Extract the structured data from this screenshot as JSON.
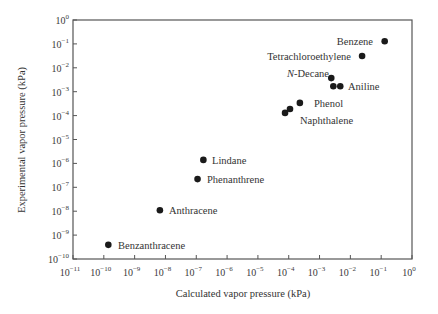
{
  "chart_data": {
    "type": "scatter",
    "title": "",
    "xlabel": "Calculated vapor pressure (kPa)",
    "ylabel": "Experimental vapor pressure (kPa)",
    "xscale": "log",
    "yscale": "log",
    "xlim": [
      1e-11,
      1
    ],
    "ylim": [
      1e-10,
      1
    ],
    "grid": false,
    "legend": null,
    "x_ticks": [
      "10^-11",
      "10^-10",
      "10^-9",
      "10^-8",
      "10^-7",
      "10^-6",
      "10^-5",
      "10^-4",
      "10^-3",
      "10^-2",
      "10^-1",
      "10^0"
    ],
    "y_ticks": [
      "10^-10",
      "10^-9",
      "10^-8",
      "10^-7",
      "10^-6",
      "10^-5",
      "10^-4",
      "10^-3",
      "10^-2",
      "10^-1",
      "10^0"
    ],
    "points": [
      {
        "label": "Benzene",
        "x": 0.13,
        "y": 0.13,
        "label_side": "left"
      },
      {
        "label": "Tetrachloroethylene",
        "x": 0.024,
        "y": 0.031,
        "label_side": "left"
      },
      {
        "label": "N-Decane",
        "x": 0.0024,
        "y": 0.0037,
        "label_side": "left",
        "italic_prefix": "N"
      },
      {
        "label": "Aniline",
        "x": 0.0028,
        "y": 0.0017,
        "label_side": "none"
      },
      {
        "label": "Aniline",
        "x": 0.0047,
        "y": 0.0017,
        "label_side": "right"
      },
      {
        "label": "Phenol",
        "x": 0.00023,
        "y": 0.00034,
        "label_side": "right"
      },
      {
        "label": "Naphthalene",
        "x": 0.00011,
        "y": 0.00019,
        "label_side": "below"
      },
      {
        "label": "Naphthalene",
        "x": 7.6e-05,
        "y": 0.00013,
        "label_side": "none"
      },
      {
        "label": "Lindane",
        "x": 1.7e-07,
        "y": 1.4e-06,
        "label_side": "right"
      },
      {
        "label": "Phenanthrene",
        "x": 1.1e-07,
        "y": 2.2e-07,
        "label_side": "right"
      },
      {
        "label": "Anthracene",
        "x": 6.6e-09,
        "y": 1.1e-08,
        "label_side": "right"
      },
      {
        "label": "Benzanthracene",
        "x": 1.4e-10,
        "y": 3.9e-10,
        "label_side": "right"
      }
    ],
    "colors": {
      "marker": "#1a1a1a",
      "axis": "#555555",
      "text": "#333333"
    }
  },
  "labels": {
    "xlabel": "Calculated vapor pressure (kPa)",
    "ylabel": "Experimental vapor pressure (kPa)",
    "point_texts": [
      {
        "text": "Benzene",
        "x": 373,
        "y": 45,
        "anchor": "end"
      },
      {
        "text": "Tetrachloroethylene",
        "x": 351,
        "y": 60,
        "anchor": "end"
      },
      {
        "text": "-Decane",
        "x": 287,
        "y": 77,
        "anchor": "start",
        "prefix": "N"
      },
      {
        "text": "Aniline",
        "x": 348,
        "y": 90,
        "anchor": "start"
      },
      {
        "text": "Phenol",
        "x": 314,
        "y": 107,
        "anchor": "start"
      },
      {
        "text": "Naphthalene",
        "x": 300,
        "y": 124,
        "anchor": "start"
      },
      {
        "text": "Lindane",
        "x": 212,
        "y": 164,
        "anchor": "start"
      },
      {
        "text": "Phenanthrene",
        "x": 207,
        "y": 183,
        "anchor": "start"
      },
      {
        "text": "Anthracene",
        "x": 169,
        "y": 214,
        "anchor": "start"
      },
      {
        "text": "Benzanthracene",
        "x": 118,
        "y": 249,
        "anchor": "start"
      }
    ]
  }
}
